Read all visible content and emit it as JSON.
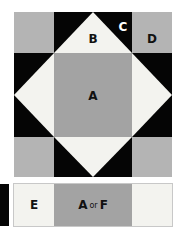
{
  "block": {
    "labels": {
      "a": "A",
      "b": "B",
      "c": "C",
      "d": "D"
    }
  },
  "strip": {
    "cells": [
      {
        "label": "E"
      },
      {
        "label_main": "A",
        "label_connector": "or",
        "label_alt": "F"
      },
      {
        "label": ""
      }
    ]
  },
  "colors": {
    "black": "#050505",
    "light_grey": "#b4b4b4",
    "mid_grey": "#a3a3a3",
    "cream": "#f3f3ef"
  }
}
